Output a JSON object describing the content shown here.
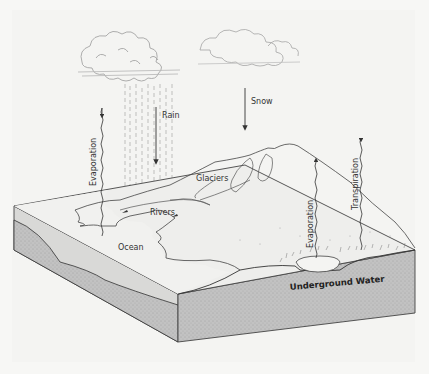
{
  "diagram": {
    "labels": {
      "rain": "Rain",
      "snow": "Snow",
      "evaporation_left": "Evaporation",
      "glaciers": "Glaciers",
      "rivers": "Rivers",
      "ocean": "Ocean",
      "evaporation_right": "Evaporation",
      "transpiration": "Transpiration",
      "underground_water": "Underground Water"
    },
    "colors": {
      "background": "#f7f7f5",
      "line": "#444444",
      "subsurface": "#b8b8b8",
      "block_side": "#c9c9c9",
      "surface": "#eeeeec"
    }
  }
}
